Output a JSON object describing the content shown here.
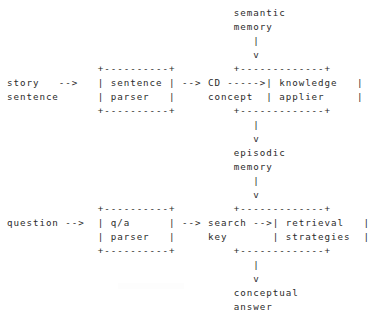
{
  "document": {
    "kind": "ascii-art-diagram",
    "title": "Story understanding and question answering pipeline",
    "background_color": "#ffffff",
    "ink_color": "#2b2b2b",
    "columns": 48,
    "rows": 20
  },
  "nodes": {
    "semantic_memory": {
      "label_line1": "semantic",
      "label_line2": "memory",
      "kind": "free-text"
    },
    "story_input": {
      "label_line1": "story",
      "label_line2": "sentence",
      "kind": "free-text"
    },
    "sentence_parser": {
      "label_line1": "sentence",
      "label_line2": "parser",
      "kind": "box"
    },
    "cd_concept": {
      "label_line1": "CD",
      "label_line2": "concept",
      "kind": "free-text"
    },
    "knowledge_applier": {
      "label_line1": "knowledge",
      "label_line2": "applier",
      "kind": "box"
    },
    "episodic_memory": {
      "label_line1": "episodic",
      "label_line2": "memory",
      "kind": "free-text"
    },
    "question_input": {
      "label_line1": "question",
      "label_line2": "",
      "kind": "free-text"
    },
    "qa_parser": {
      "label_line1": "q/a",
      "label_line2": "parser",
      "kind": "box"
    },
    "search_key": {
      "label_line1": "search",
      "label_line2": "key",
      "kind": "free-text"
    },
    "retrieval_strategies": {
      "label_line1": "retrieval",
      "label_line2": "strategies",
      "kind": "box"
    },
    "conceptual_answer": {
      "label_line1": "conceptual",
      "label_line2": "answer",
      "kind": "free-text"
    }
  },
  "connectors": {
    "semantic_to_knowledge": "|  v",
    "story_to_parser": "-->",
    "parser_to_cd": "-->",
    "cd_to_knowledge": "----->",
    "knowledge_to_episodic": "|  v",
    "episodic_to_retrieval": "|  v",
    "question_to_parser": "-->",
    "parser_to_search": "-->",
    "search_to_retrieval": "-->",
    "retrieval_to_answer": "|  v"
  },
  "ascii": {
    "art": "                                    semantic\n                                    memory\n                                       |\n                                       v\n               +----------+         +------------+\nstory    -->   | sentence |  --> CD ----->| knowledge  |\nsentence       | parser   |      concept  | applier    |\n               +----------+         +------------+\n                                       |\n                                       v\n                                    episodic\n                                    memory\n                                       |\n                                       v\n               +----------+         +------------+\nquestion -->   | q/a      |  --> search -->| retrieval  |\n               | parser   |      key      | strategies |\n               +----------+         +------------+\n                                       |\n                                       v\n                                    conceptual\n                                    answer",
    "lines": [
      "                                   semantic",
      "                                   memory",
      "                                      |",
      "                                      v",
      "              +----------+         +------------+",
      "story   -->   | sentence |  --> CD ----->| knowledge  |",
      "sentence      | parser   |      concept  | applier    |",
      "              +----------+         +------------+"
    ]
  },
  "grid": {
    "line_01": "                                   semantic",
    "line_02": "                                   memory",
    "line_03": "                                      |",
    "line_04": "                                      v",
    "line_05": "              +----------+         +-------------+",
    "line_06": "story   -->   | sentence | --> CD ----->| knowledge   |",
    "line_07": "sentence      | parser   |     concept  | applier     |",
    "line_08": "              +----------+         +-------------+",
    "line_09": "                                      |",
    "line_10": "                                      v",
    "line_11": "                                   episodic",
    "line_12": "                                   memory",
    "line_13": "                                      |",
    "line_14": "                                      v",
    "line_15": "              +----------+         +-------------+",
    "line_16": "question -->  | q/a      | --> search -->| retrieval   |",
    "line_17": "              | parser   |     key       | strategies  |",
    "line_18": "              +----------+         +-------------+",
    "line_19": "                                      |",
    "line_20": "                                      v",
    "line_21": "                                   conceptual",
    "line_22": "                                   answer"
  }
}
